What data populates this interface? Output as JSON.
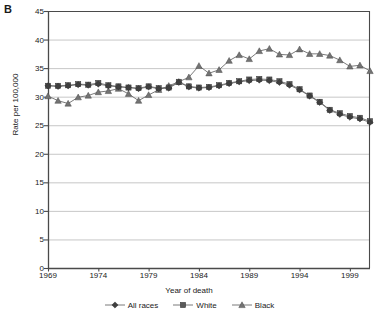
{
  "panel": {
    "label": "B"
  },
  "axes": {
    "ylabel": "Rate per 100,000",
    "xlabel": "Year of death",
    "yticks": [
      "0",
      "5",
      "10",
      "15",
      "20",
      "25",
      "30",
      "35",
      "40",
      "45"
    ],
    "xticks": [
      "1969",
      "1974",
      "1979",
      "1984",
      "1989",
      "1994",
      "1999"
    ]
  },
  "legend": {
    "items": [
      {
        "label": "All races",
        "marker": "diamond",
        "color": "#3f3f3f"
      },
      {
        "label": "White",
        "marker": "square",
        "color": "#5a5a5a"
      },
      {
        "label": "Black",
        "marker": "triangle",
        "color": "#737373"
      }
    ]
  },
  "chart_data": {
    "type": "line",
    "title": "",
    "xlabel": "Year of death",
    "ylabel": "Rate per 100,000",
    "xlim": [
      1969,
      2001
    ],
    "ylim": [
      0,
      45
    ],
    "ytick_step": 5,
    "xtick_step": 5,
    "grid": "horizontal",
    "legend_position": "bottom",
    "x": [
      1969,
      1970,
      1971,
      1972,
      1973,
      1974,
      1975,
      1976,
      1977,
      1978,
      1979,
      1980,
      1981,
      1982,
      1983,
      1984,
      1985,
      1986,
      1987,
      1988,
      1989,
      1990,
      1991,
      1992,
      1993,
      1994,
      1995,
      1996,
      1997,
      1998,
      1999,
      2000,
      2001
    ],
    "series": [
      {
        "name": "All races",
        "marker": "diamond",
        "color": "#3f3f3f",
        "values": [
          31.9,
          31.8,
          31.9,
          32.1,
          32.0,
          32.2,
          31.9,
          31.7,
          31.6,
          31.4,
          31.7,
          31.4,
          31.5,
          32.5,
          31.7,
          31.5,
          31.6,
          31.9,
          32.3,
          32.6,
          32.8,
          32.9,
          32.8,
          32.5,
          32.0,
          31.2,
          30.1,
          29.0,
          27.6,
          26.9,
          26.4,
          26.1,
          25.5
        ]
      },
      {
        "name": "White",
        "marker": "square",
        "color": "#5a5a5a",
        "values": [
          31.9,
          31.9,
          32.0,
          32.2,
          32.1,
          32.4,
          32.0,
          31.8,
          31.6,
          31.5,
          31.8,
          31.5,
          31.6,
          32.6,
          31.8,
          31.6,
          31.7,
          32.0,
          32.4,
          32.7,
          33.0,
          33.1,
          33.0,
          32.7,
          32.2,
          31.3,
          30.2,
          29.1,
          27.7,
          27.1,
          26.6,
          26.3,
          25.7
        ]
      },
      {
        "name": "Black",
        "marker": "triangle",
        "color": "#737373",
        "values": [
          30.1,
          29.3,
          28.8,
          29.9,
          30.2,
          30.8,
          31.0,
          31.4,
          30.5,
          29.3,
          30.3,
          31.2,
          31.9,
          32.6,
          33.4,
          35.4,
          34.1,
          34.7,
          36.3,
          37.3,
          36.6,
          38.0,
          38.4,
          37.4,
          37.3,
          38.3,
          37.5,
          37.5,
          37.2,
          36.4,
          35.3,
          35.5,
          34.5
        ]
      }
    ]
  }
}
